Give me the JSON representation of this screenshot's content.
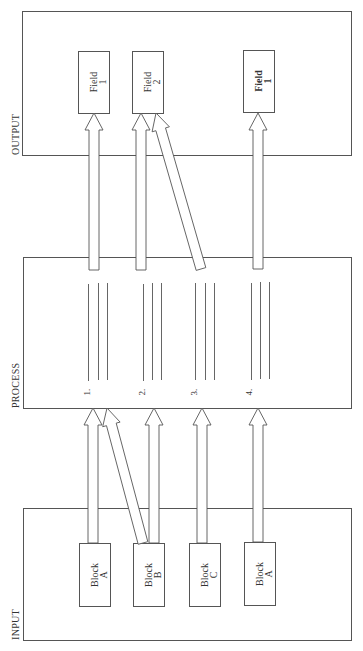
{
  "sections": {
    "output": "OUTPUT",
    "process": "PROCESS",
    "input": "INPUT"
  },
  "output_fields": [
    {
      "line1": "Field",
      "line2": "1",
      "bold": false
    },
    {
      "line1": "Field",
      "line2": "2",
      "bold": false
    },
    {
      "line1": "Field",
      "line2": "1",
      "bold": true
    }
  ],
  "process_steps": [
    {
      "label": "1."
    },
    {
      "label": "2."
    },
    {
      "label": "3."
    },
    {
      "label": "4."
    }
  ],
  "input_blocks": [
    {
      "line1": "Block",
      "line2": "A"
    },
    {
      "line1": "Block",
      "line2": "B"
    },
    {
      "line1": "Block",
      "line2": "C"
    },
    {
      "line1": "Block",
      "line2": "A"
    }
  ],
  "connections": {
    "input_to_process": [
      {
        "from": "input_blocks.0",
        "to": "process_steps.0"
      },
      {
        "from": "input_blocks.1",
        "to": "process_steps.0"
      },
      {
        "from": "input_blocks.1",
        "to": "process_steps.1"
      },
      {
        "from": "input_blocks.2",
        "to": "process_steps.2"
      },
      {
        "from": "input_blocks.3",
        "to": "process_steps.3"
      }
    ],
    "process_to_output": [
      {
        "from": "process_steps.0",
        "to": "output_fields.0"
      },
      {
        "from": "process_steps.1",
        "to": "output_fields.1"
      },
      {
        "from": "process_steps.2",
        "to": "output_fields.1"
      },
      {
        "from": "process_steps.3",
        "to": "output_fields.2"
      }
    ]
  }
}
